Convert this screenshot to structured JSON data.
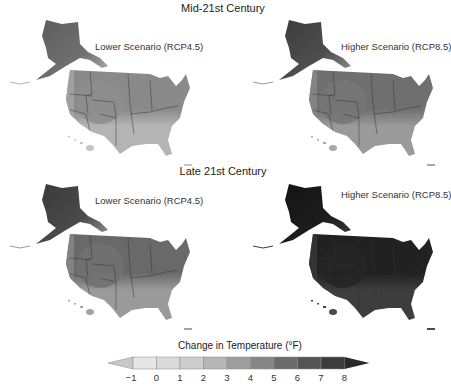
{
  "rows": [
    {
      "title": "Mid-21st Century",
      "panels": [
        {
          "label": "Lower Scenario (RCP4.5)",
          "alaska": "#6f6f6f",
          "alaska_n": "#5d5d5d",
          "north": "#8a8a8a",
          "south": "#b4b4b4",
          "west": "#a6a6a6",
          "center": "#8e8e8e",
          "hawaii": "#c4c4c4"
        },
        {
          "label": "Higher Scenario (RCP8.5)",
          "alaska": "#4e4e4e",
          "alaska_n": "#3c3c3c",
          "north": "#707070",
          "south": "#9a9a9a",
          "west": "#8a8a8a",
          "center": "#777777",
          "hawaii": "#a8a8a8"
        }
      ]
    },
    {
      "title": "Late 21st Century",
      "panels": [
        {
          "label": "Lower Scenario (RCP4.5)",
          "alaska": "#4a4a4a",
          "alaska_n": "#3a3a3a",
          "north": "#6a6a6a",
          "south": "#9a9a9a",
          "west": "#888888",
          "center": "#727272",
          "hawaii": "#a4a4a4"
        },
        {
          "label": "Higher Scenario (RCP8.5)",
          "alaska": "#1c1c1c",
          "alaska_n": "#141414",
          "north": "#222222",
          "south": "#3e3e3e",
          "west": "#3a3a3a",
          "center": "#262626",
          "hawaii": "#4a4a4a"
        }
      ]
    }
  ],
  "legend": {
    "title": "Change in Temperature (°F)",
    "ticks": [
      "-1",
      "0",
      "1",
      "2",
      "3",
      "4",
      "5",
      "6",
      "7",
      "8"
    ],
    "colors": [
      "#e6e6e6",
      "#dadada",
      "#cdcdcd",
      "#b6b6b6",
      "#9e9e9e",
      "#868686",
      "#6c6c6c",
      "#555555",
      "#3c3c3c"
    ],
    "below_color": "#c8c8c8",
    "above_color": "#2a2a2a"
  }
}
